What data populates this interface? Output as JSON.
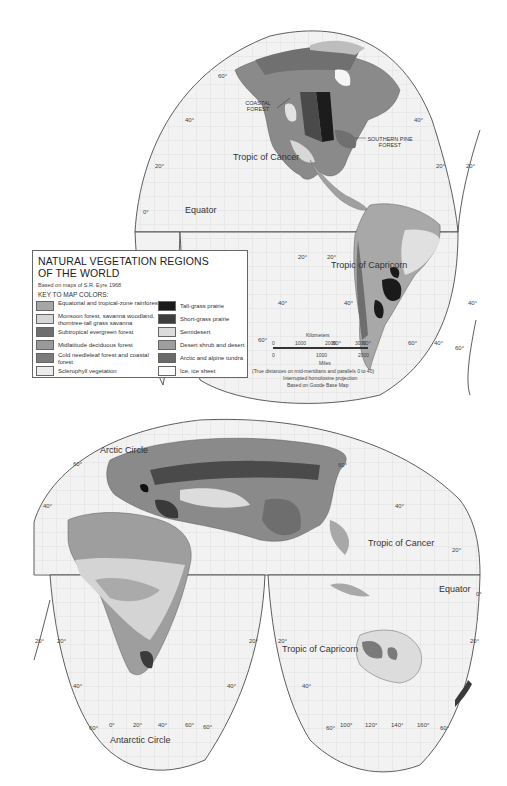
{
  "legend": {
    "title_line1": "NATURAL VEGETATION REGIONS",
    "title_line2": "OF THE WORLD",
    "source": "Based on maps of S.R. Eyre  1968",
    "key_heading": "KEY TO MAP COLORS:",
    "left_items": [
      {
        "label": "Equatorial and tropical-zone rainforests",
        "color": "#a6a6a6"
      },
      {
        "label": "Monsoon forest, savanna woodland, thorntree-tall grass savanna",
        "color": "#d6d6d6"
      },
      {
        "label": "Subtropical evergreen forest",
        "color": "#6e6e6e"
      },
      {
        "label": "Midlatitude deciduous forest",
        "color": "#9a9a9a"
      },
      {
        "label": "Cold needleleaf forest and coastal forest",
        "color": "#7c7c7c"
      },
      {
        "label": "Sclerophyll vegetation",
        "color": "#ececec"
      }
    ],
    "right_items": [
      {
        "label": "Tall-grass prairie",
        "color": "#1a1a1a"
      },
      {
        "label": "Short-grass prairie",
        "color": "#3e3e3e"
      },
      {
        "label": "Semidesert",
        "color": "#dcdcdc"
      },
      {
        "label": "Desert shrub and desert",
        "color": "#9e9e9e"
      },
      {
        "label": "Arctic and alpine tundra",
        "color": "#6a6a6a"
      },
      {
        "label": "Ice, ice sheet",
        "color": "#ffffff"
      }
    ]
  },
  "scale": {
    "km_label": "Kilometers",
    "km_ticks": [
      "0",
      "1000",
      "2000",
      "3000"
    ],
    "mi_ticks": [
      "0",
      "1000",
      "2000"
    ],
    "mi_label": "Miles",
    "note1": "(True distances on mid-meridians and parallels 0 to 40)",
    "note2": "Interrupted homolosine projection",
    "note3": "Based on Goode Base Map"
  },
  "upper_map": {
    "annotations": {
      "coastal_forest_1": "COASTAL",
      "coastal_forest_2": "FOREST",
      "southern_pine_1": "SOUTHERN PINE",
      "southern_pine_2": "FOREST",
      "tropic_cancer": "Tropic of Cancer",
      "equator": "Equator",
      "tropic_capricorn": "Tropic of Capricorn"
    },
    "lat_labels": {
      "l60": "60°",
      "l40a": "40°",
      "l40b": "40°",
      "l20a": "20°",
      "l20b": "20°",
      "l20c": "20°",
      "l0": "0°",
      "s20a": "20°",
      "s20b": "20°",
      "s40a": "40°",
      "s40b": "40°",
      "s40c": "40°",
      "s60a": "60°",
      "s60b": "60°",
      "s60c": "60°",
      "s40d": "40°",
      "s60d": "60°",
      "s80": "80°"
    }
  },
  "lower_map": {
    "annotations": {
      "arctic_circle": "Arctic Circle",
      "tropic_cancer": "Tropic of Cancer",
      "equator": "Equator",
      "tropic_capricorn": "Tropic of Capricorn",
      "antarctic_circle": "Antarctic Circle"
    },
    "lat_labels": {
      "n60a": "60°",
      "n40a": "40°",
      "n60b": "60°",
      "n40b": "40°",
      "n20": "20°",
      "e0": "0°",
      "s20a": "20°",
      "s20b": "20°",
      "s20c": "20°",
      "s20d": "20°",
      "s20e": "20°",
      "s40a": "40°",
      "s40b": "40°",
      "s40c": "40°",
      "lon60a": "60°",
      "lon0": "0°",
      "lon20": "20°",
      "lon40": "40°",
      "lon60b": "60°",
      "lon60c": "60°",
      "lon60d": "60°",
      "lon100": "100°",
      "lon120": "120°",
      "lon140": "140°",
      "lon160": "160°",
      "lon60e": "60°"
    }
  }
}
